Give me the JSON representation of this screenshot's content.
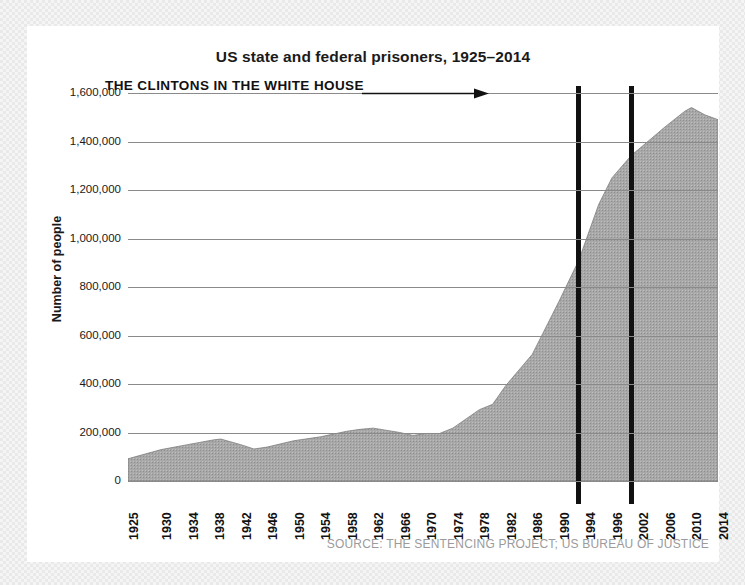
{
  "chart_data": {
    "type": "area",
    "title": "US state and federal prisoners, 1925–2014",
    "xlabel": "",
    "ylabel": "Number of people",
    "ylim": [
      0,
      1600000
    ],
    "xlim": [
      1925,
      2014
    ],
    "grid": true,
    "legend": "none",
    "fill_color": "#a8a8a8",
    "gridline_color": "#8a8a8a",
    "ytick_labels": [
      "1,600,000",
      "1,400,000",
      "1,200,000",
      "1,000,000",
      "800,000",
      "600,000",
      "400,000",
      "200,000",
      "0"
    ],
    "ytick_values": [
      1600000,
      1400000,
      1200000,
      1000000,
      800000,
      600000,
      400000,
      200000,
      0
    ],
    "xtick_labels": [
      "1925",
      "1930",
      "1934",
      "1938",
      "1942",
      "1946",
      "1950",
      "1954",
      "1958",
      "1962",
      "1966",
      "1970",
      "1974",
      "1978",
      "1982",
      "1986",
      "1990",
      "1994",
      "1996",
      "2002",
      "2006",
      "2010",
      "2014"
    ],
    "xtick_values": [
      1925,
      1930,
      1934,
      1938,
      1942,
      1946,
      1950,
      1954,
      1958,
      1962,
      1966,
      1970,
      1974,
      1978,
      1982,
      1986,
      1990,
      1994,
      1998,
      2002,
      2006,
      2010,
      2014
    ],
    "x": [
      1925,
      1930,
      1934,
      1938,
      1939,
      1942,
      1944,
      1946,
      1950,
      1954,
      1958,
      1960,
      1962,
      1966,
      1968,
      1970,
      1972,
      1974,
      1978,
      1980,
      1982,
      1986,
      1990,
      1993,
      1996,
      1998,
      2001,
      2002,
      2006,
      2009,
      2010,
      2012,
      2014
    ],
    "values": [
      91669,
      129453,
      150000,
      170000,
      173000,
      150000,
      132000,
      140000,
      166000,
      182000,
      205000,
      213000,
      218000,
      200000,
      188000,
      196000,
      196000,
      218000,
      294000,
      316000,
      394000,
      523000,
      740000,
      910000,
      1140000,
      1250000,
      1345000,
      1367000,
      1460000,
      1525000,
      1540000,
      1510000,
      1490000
    ],
    "annotations": [
      {
        "name": "clintons-in-white-house",
        "text": "THE CLINTONS IN THE WHITE HOUSE",
        "arrow": true,
        "target_year": 1993
      },
      {
        "name": "vertical-marker-1993",
        "type": "vertical-line",
        "year": 1993,
        "color": "#111111"
      },
      {
        "name": "vertical-marker-2001",
        "type": "vertical-line",
        "year": 2001,
        "color": "#111111"
      }
    ],
    "source": "SOURCE: THE SENTENCING PROJECT; US BUREAU OF JUSTICE"
  }
}
